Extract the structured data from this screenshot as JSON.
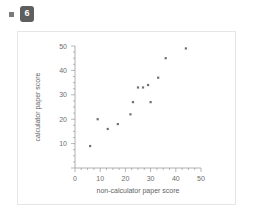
{
  "header": {
    "bullet_icon": "square-bullet-icon",
    "question_number": "6"
  },
  "chart_data": {
    "type": "scatter",
    "title": "",
    "xlabel": "non-calculator paper score",
    "ylabel": "calculator paper score",
    "xlim": [
      0,
      50
    ],
    "ylim": [
      0,
      50
    ],
    "xticks": [
      "0",
      "10",
      "20",
      "30",
      "40",
      "50"
    ],
    "yticks": [
      "10",
      "20",
      "30",
      "40",
      "50"
    ],
    "xtick_values": [
      0,
      10,
      20,
      30,
      40,
      50
    ],
    "ytick_values": [
      10,
      20,
      30,
      40,
      50
    ],
    "grid": false,
    "legend": false,
    "marker": "square",
    "marker_color": "#6f6f7a",
    "points": [
      {
        "x": 6,
        "y": 9
      },
      {
        "x": 9,
        "y": 20
      },
      {
        "x": 13,
        "y": 16
      },
      {
        "x": 17,
        "y": 18
      },
      {
        "x": 22,
        "y": 22
      },
      {
        "x": 23,
        "y": 27
      },
      {
        "x": 25,
        "y": 33
      },
      {
        "x": 27,
        "y": 33
      },
      {
        "x": 29,
        "y": 34
      },
      {
        "x": 30,
        "y": 27
      },
      {
        "x": 33,
        "y": 37
      },
      {
        "x": 36,
        "y": 45
      },
      {
        "x": 44,
        "y": 49
      }
    ]
  },
  "colors": {
    "card_background": "#ffffff",
    "card_border": "#e6e6e6",
    "axis": "#9a9a9a",
    "text": "#6d6d6d",
    "badge_background": "#5e5e5e",
    "badge_text": "#ffffff",
    "bullet": "#7a7a7a"
  }
}
